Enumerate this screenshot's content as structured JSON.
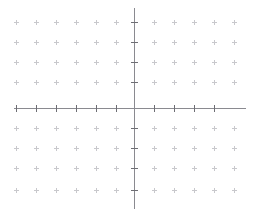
{
  "chart_data": {
    "type": "scatter",
    "title": "",
    "subtitle": "",
    "xlabel": "",
    "ylabel": "",
    "series": [
      {
        "name": "data-points",
        "x": [],
        "y": []
      }
    ],
    "x": [],
    "values": [],
    "categories": [],
    "annotations": [],
    "legend": {
      "entries": [],
      "position": "none",
      "visible": false
    },
    "grid": {
      "visible": true,
      "style": "plus-markers",
      "spacing_px": 20,
      "x_positions_px": [
        16,
        36,
        56,
        76,
        96,
        116,
        154,
        174,
        194,
        214,
        234
      ],
      "y_positions_px": [
        22,
        42,
        62,
        82,
        128,
        148,
        168,
        190
      ],
      "color": "#c8c8cc"
    },
    "axes": {
      "origin_px": {
        "x": 134,
        "y": 108
      },
      "x_axis": {
        "visible": true,
        "start_px": 14,
        "end_px": 246,
        "color": "#8a8a90",
        "tick_color": "#6e6e74",
        "tick_length_px": 7,
        "tick_positions_px": [
          16,
          36,
          56,
          76,
          96,
          116,
          154,
          174,
          194,
          214
        ],
        "tick_labels": []
      },
      "y_axis": {
        "visible": true,
        "start_px": 8,
        "end_px": 209,
        "color": "#8a8a90",
        "tick_color": "#6e6e74",
        "tick_length_px": 7,
        "tick_positions_px": [
          22,
          42,
          62,
          82,
          128,
          148,
          168,
          190
        ],
        "tick_labels": []
      },
      "xlim": [
        -6,
        6
      ],
      "ylim": [
        -5,
        5
      ]
    },
    "background_color": "#ffffff"
  }
}
